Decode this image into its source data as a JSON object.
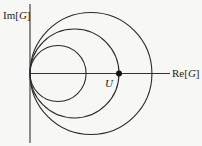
{
  "diagram": {
    "y_axis_label": {
      "prefix": "Im[",
      "symbol": "G",
      "suffix": "]"
    },
    "x_axis_label": {
      "prefix": "Re[",
      "symbol": "G",
      "suffix": "]"
    },
    "point_label": "U",
    "circles": [
      {
        "name": "inner-circle",
        "diameter_rel": 0.63
      },
      {
        "name": "middle-circle",
        "diameter_rel": 1.0
      },
      {
        "name": "outer-circle",
        "diameter_rel": 1.37
      }
    ],
    "point_U_rel": 1.0,
    "colors": {
      "line": "#2a2a2a",
      "background": "#f7f7f5"
    }
  }
}
